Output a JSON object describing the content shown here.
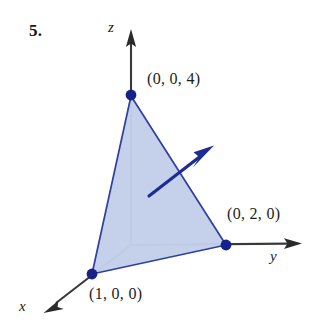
{
  "figure": {
    "problem_number": "5.",
    "caption_numbers": {
      "vertex_z_label": "(0, 0, 4)",
      "vertex_y_label": "(0, 2, 0)",
      "vertex_x_label": "(1, 0, 0)"
    },
    "axes": [
      {
        "name": "z-axis",
        "label": "z",
        "direction": "up"
      },
      {
        "name": "y-axis",
        "label": "y",
        "direction": "right"
      },
      {
        "name": "x-axis",
        "label": "x",
        "direction": "down-left"
      }
    ],
    "colors": {
      "triangle_fill": "#c3cfe9",
      "triangle_edge": "#2f3fa0",
      "vertex_dot": "#16218a",
      "normal_vector": "#1d2c93",
      "axis_line": "#39393b",
      "text": "#1c1c1c"
    },
    "geometry": {
      "origin": {
        "x": 131,
        "y": 245
      },
      "vertices": [
        {
          "name": "(0, 0, 4)",
          "px": 131,
          "py": 96
        },
        {
          "name": "(0, 2, 0)",
          "px": 226,
          "py": 245
        },
        {
          "name": "(1, 0, 0)",
          "px": 92,
          "py": 274
        }
      ],
      "normal_vector": {
        "tail_x": 149,
        "tail_y": 196,
        "tip_x": 212,
        "tip_y": 147
      },
      "z_axis_tip": {
        "x": 131,
        "y": 31
      },
      "y_axis_tip": {
        "x": 301,
        "y": 244
      },
      "x_axis_tip": {
        "x": 44,
        "y": 312
      }
    }
  }
}
